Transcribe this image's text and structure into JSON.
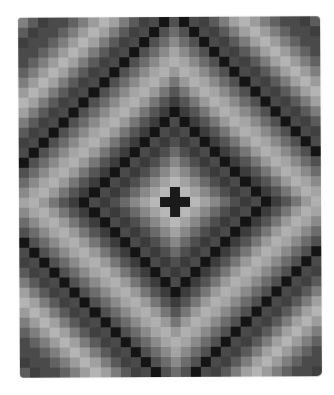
{
  "image": {
    "subject": "Trip Around the World pattern quilt",
    "style": "grayscale photograph",
    "background": "#ffffff"
  },
  "quilt": {
    "columns": 30,
    "rows": 36,
    "cell_px": 10.07,
    "center": {
      "col": 15,
      "row": 18
    },
    "center_motif": "black cross",
    "ring_palette": [
      "#1a1a1a",
      "#1c1c1c",
      "#b8b8b8",
      "#a2a2a2",
      "#888888",
      "#6a6a6a",
      "#4e4e4e",
      "#3a3a3a",
      "checker",
      "checker",
      "#3c3c3c",
      "#555555",
      "#767676",
      "#999999",
      "#b0b0b0",
      "#a4a4a4",
      "#8a8a8a",
      "#6c6c6c",
      "#505050",
      "checker",
      "checker",
      "#404040",
      "#5a5a5a",
      "#7c7c7c",
      "#a0a0a0",
      "#b4b4b4",
      "#9c9c9c",
      "#7e7e7e",
      "#626262",
      "#4a4a4a",
      "checker",
      "#3e3e3e",
      "#5c5c5c",
      "#808080"
    ],
    "checker_colors": [
      "#141414",
      "#4a4a4a"
    ]
  }
}
